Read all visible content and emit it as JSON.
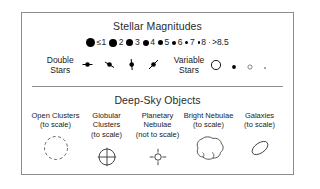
{
  "legend": {
    "stellar": {
      "title": "Stellar Magnitudes",
      "magnitudes": [
        {
          "label": "≤1",
          "size": 9
        },
        {
          "label": "2",
          "size": 8
        },
        {
          "label": "3",
          "size": 7
        },
        {
          "label": "4",
          "size": 6
        },
        {
          "label": "5",
          "size": 5
        },
        {
          "label": "6",
          "size": 4
        },
        {
          "label": "7",
          "size": 3
        },
        {
          "label": "8",
          "size": 2.2
        },
        {
          "label": ">8.5",
          "size": 1.4
        }
      ],
      "double_stars": {
        "label": "Double\nStars",
        "symbols": [
          "double-star-bar-horizontal",
          "double-star-bar-diagonal",
          "double-star-bar-vertical",
          "double-star-bar-steep"
        ]
      },
      "variable_stars": {
        "label": "Variable\nStars",
        "symbols": [
          "variable-circle-large",
          "variable-dot-filled",
          "variable-circle-small",
          "variable-dot-tiny"
        ]
      }
    },
    "deepsky": {
      "title": "Deep-Sky Objects",
      "items": [
        {
          "label": "Open Clusters\n(to scale)",
          "icon": "open-cluster-dashed-circle"
        },
        {
          "label": "Globular Clusters\n(to scale)",
          "icon": "globular-cluster-crossed-circle"
        },
        {
          "label": "Planetary\nNebulae\n(not to scale)",
          "icon": "planetary-nebula-rayed-circle"
        },
        {
          "label": "Bright Nebulae\n(to scale)",
          "icon": "bright-nebula-blob"
        },
        {
          "label": "Galaxies\n(to scale)",
          "icon": "galaxy-ellipse"
        }
      ]
    }
  },
  "colors": {
    "ink": "#1a1a1a",
    "border": "#8c8c8c",
    "background": "#ffffff"
  }
}
